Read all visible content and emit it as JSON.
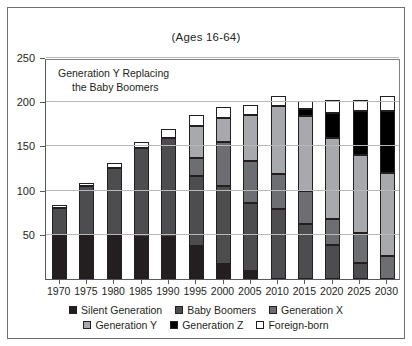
{
  "chart_data": {
    "type": "bar",
    "title": "(Ages 16-64)",
    "subtitle": "",
    "annotation": {
      "line1": "Generation Y Replacing",
      "line2": "the Baby Boomers"
    },
    "xlabel": "",
    "ylabel": "",
    "stacked": true,
    "grid": true,
    "legend_position": "bottom",
    "ylim": [
      0,
      250
    ],
    "yticks": [
      50,
      100,
      150,
      200,
      250
    ],
    "ytick_labels": [
      "50",
      "100",
      "150",
      "200",
      "250"
    ],
    "categories": [
      "1970",
      "1975",
      "1980",
      "1985",
      "1990",
      "1995",
      "2000",
      "2005",
      "2010",
      "2015",
      "2020",
      "2025",
      "2030"
    ],
    "series": [
      {
        "name": "Silent Generation",
        "color": "#231f20",
        "values": [
          50,
          50,
          49,
          48,
          47,
          37,
          17,
          9,
          0,
          0,
          0,
          0,
          0
        ]
      },
      {
        "name": "Baby Boomers",
        "color": "#4d4d4f",
        "values": [
          30,
          55,
          77,
          100,
          113,
          79,
          88,
          77,
          79,
          62,
          38,
          18,
          0
        ]
      },
      {
        "name": "Generation X",
        "color": "#6d6e71",
        "values": [
          0,
          0,
          0,
          0,
          0,
          21,
          50,
          48,
          40,
          38,
          30,
          34,
          26
        ]
      },
      {
        "name": "Generation Y",
        "color": "#a7a9ac",
        "values": [
          0,
          0,
          0,
          0,
          0,
          36,
          27,
          51,
          77,
          84,
          92,
          88,
          94
        ]
      },
      {
        "name": "Generation Z",
        "color": "#000000",
        "values": [
          0,
          0,
          0,
          0,
          0,
          0,
          0,
          0,
          0,
          8,
          28,
          50,
          70
        ]
      },
      {
        "name": "Foreign-born",
        "color": "#ffffff",
        "values": [
          4,
          4,
          5,
          7,
          10,
          13,
          13,
          12,
          11,
          9,
          14,
          13,
          17
        ]
      }
    ],
    "totals": [
      84,
      109,
      131,
      155,
      170,
      186,
      195,
      197,
      207,
      201,
      202,
      203,
      207
    ]
  },
  "legend": {
    "row1": [
      {
        "label": "Silent Generation",
        "color": "#231f20"
      },
      {
        "label": "Baby Boomers",
        "color": "#4d4d4f"
      },
      {
        "label": "Generation X",
        "color": "#6d6e71"
      }
    ],
    "row2": [
      {
        "label": "Generation Y",
        "color": "#a7a9ac"
      },
      {
        "label": "Generation Z",
        "color": "#000000"
      },
      {
        "label": "Foreign-born",
        "color": "#ffffff"
      }
    ]
  }
}
